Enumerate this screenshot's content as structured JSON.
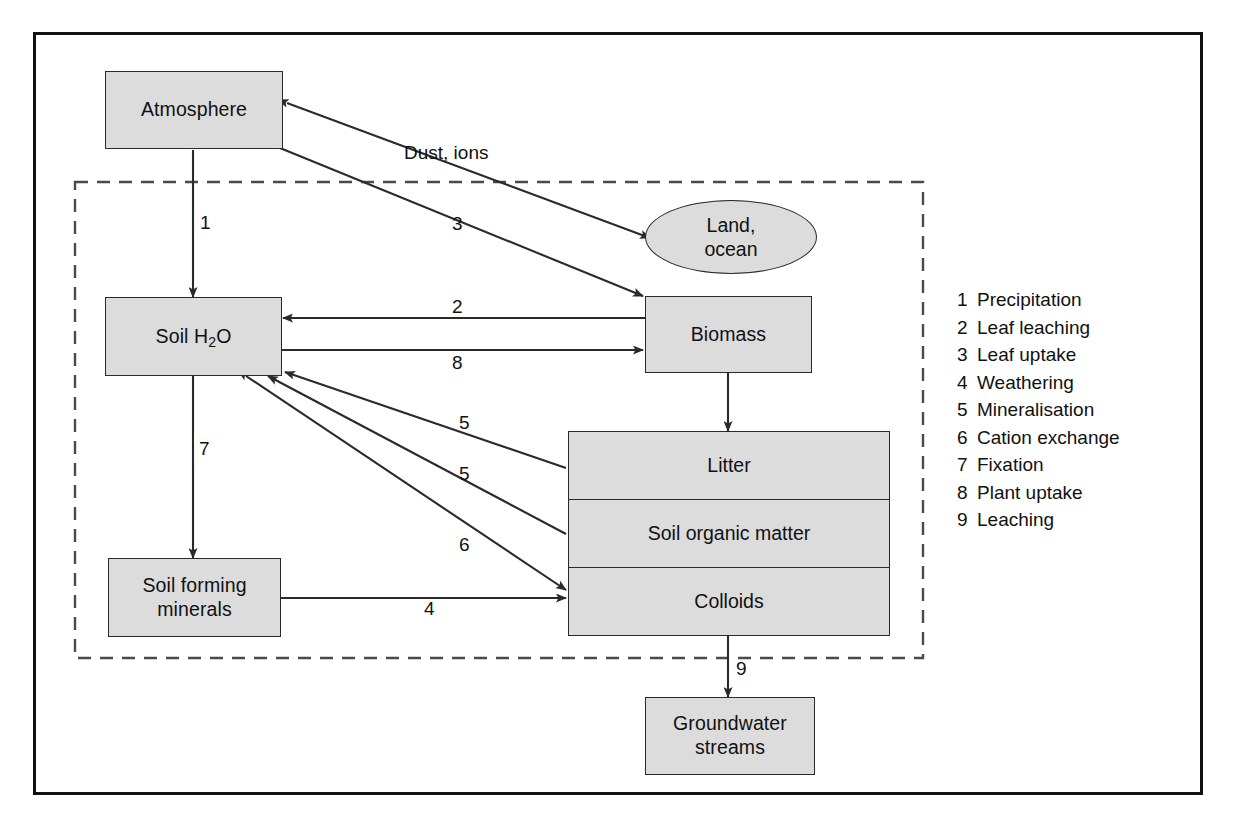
{
  "figure": {
    "boundary_style": "dashed",
    "frame_color": "#111111",
    "node_fill": "#dcdcdc",
    "node_stroke": "#2a2a2a"
  },
  "nodes": {
    "atmosphere": "Atmosphere",
    "land_ocean_line1": "Land,",
    "land_ocean_line2": "ocean",
    "soil_water_pre": "Soil H",
    "soil_water_sub": "2",
    "soil_water_post": "O",
    "biomass": "Biomass",
    "litter": "Litter",
    "soil_organic_matter": "Soil organic matter",
    "colloids": "Colloids",
    "soil_forming_line1": "Soil forming",
    "soil_forming_line2": "minerals",
    "groundwater_line1": "Groundwater",
    "groundwater_line2": "streams"
  },
  "edge_labels": {
    "dust_ions": "Dust, ions",
    "n1": "1",
    "n2": "2",
    "n3": "3",
    "n4": "4",
    "n5_litter": "5",
    "n5_som": "5",
    "n6": "6",
    "n7": "7",
    "n8": "8",
    "n9": "9"
  },
  "legend": [
    {
      "num": "1",
      "label": "Precipitation"
    },
    {
      "num": "2",
      "label": "Leaf leaching"
    },
    {
      "num": "3",
      "label": "Leaf uptake"
    },
    {
      "num": "4",
      "label": "Weathering"
    },
    {
      "num": "5",
      "label": "Mineralisation"
    },
    {
      "num": "6",
      "label": "Cation exchange"
    },
    {
      "num": "7",
      "label": "Fixation"
    },
    {
      "num": "8",
      "label": "Plant uptake"
    },
    {
      "num": "9",
      "label": "Leaching"
    }
  ],
  "flows": [
    {
      "id": "1",
      "from": "Atmosphere",
      "to": "Soil H2O",
      "process": "Precipitation"
    },
    {
      "id": "2",
      "from": "Biomass",
      "to": "Soil H2O",
      "process": "Leaf leaching"
    },
    {
      "id": "3",
      "from": "Atmosphere",
      "to": "Biomass",
      "process": "Leaf uptake"
    },
    {
      "id": "4",
      "from": "Soil forming minerals",
      "to": "Colloids",
      "process": "Weathering"
    },
    {
      "id": "5",
      "from": "Litter",
      "to": "Soil H2O",
      "process": "Mineralisation"
    },
    {
      "id": "5",
      "from": "Soil organic matter",
      "to": "Soil H2O",
      "process": "Mineralisation"
    },
    {
      "id": "6",
      "from": "Soil H2O",
      "to": "Colloids",
      "process": "Cation exchange",
      "bidirectional": "true"
    },
    {
      "id": "7",
      "from": "Soil H2O",
      "to": "Soil forming minerals",
      "process": "Fixation"
    },
    {
      "id": "8",
      "from": "Soil H2O",
      "to": "Biomass",
      "process": "Plant uptake"
    },
    {
      "id": "9",
      "from": "Colloids",
      "to": "Groundwater streams",
      "process": "Leaching"
    },
    {
      "id": "dust",
      "from": "Atmosphere",
      "to": "Land, ocean",
      "process": "Dust, ions",
      "bidirectional": "true"
    },
    {
      "id": "biomass-litter",
      "from": "Biomass",
      "to": "Litter",
      "process": ""
    }
  ]
}
